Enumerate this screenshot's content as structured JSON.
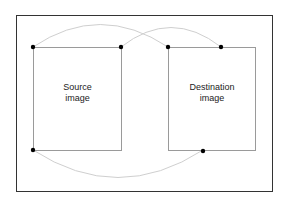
{
  "diagram": {
    "source": {
      "label_line1": "Source",
      "label_line2": "image"
    },
    "destination": {
      "label_line1": "Destination",
      "label_line2": "image"
    },
    "colors": {
      "frame": "#333333",
      "box_border": "#9a9a9a",
      "connector": "#cfcfcf",
      "dot": "#000000"
    },
    "points": {
      "source_top_left": [
        33,
        47
      ],
      "source_top_right": [
        121,
        47
      ],
      "source_bottom_left": [
        33,
        150
      ],
      "destination_top_left": [
        168,
        47
      ],
      "destination_top_inner": [
        221,
        47
      ],
      "destination_bottom_inner": [
        203,
        150
      ]
    },
    "connections": [
      {
        "from": "source_top_left",
        "to": "destination_top_left"
      },
      {
        "from": "source_top_right",
        "to": "destination_top_inner"
      },
      {
        "from": "source_bottom_left",
        "to": "destination_bottom_inner"
      }
    ]
  }
}
